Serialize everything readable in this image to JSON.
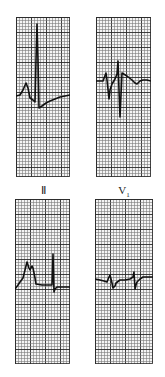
{
  "figure": {
    "grid": {
      "small_cell_px": 3,
      "major_every": 5,
      "minor_color": "#7a7a7a",
      "major_color": "#2a2a2a",
      "paper_color": "#f4f4f4"
    },
    "trace_color": "#111111",
    "labels": {
      "top_left": "Ⅱ",
      "top_right_main": "V",
      "top_right_sub": "1"
    },
    "panels": [
      {
        "id": "top-left",
        "lead": "II",
        "x": 16,
        "y": 17,
        "w": 54,
        "h": 160,
        "trace": [
          [
            16,
            96
          ],
          [
            20,
            95
          ],
          [
            23,
            90
          ],
          [
            26,
            83
          ],
          [
            28,
            88
          ],
          [
            30,
            98
          ],
          [
            33,
            100
          ],
          [
            35,
            102
          ],
          [
            36,
            60
          ],
          [
            37,
            24
          ],
          [
            38,
            60
          ],
          [
            39,
            108
          ],
          [
            42,
            106
          ],
          [
            46,
            103
          ],
          [
            50,
            101
          ],
          [
            55,
            99
          ],
          [
            60,
            97
          ],
          [
            65,
            96
          ],
          [
            70,
            95
          ]
        ]
      },
      {
        "id": "top-right",
        "lead": "V1",
        "x": 96,
        "y": 17,
        "w": 55,
        "h": 160,
        "trace": [
          [
            96,
            81
          ],
          [
            103,
            81
          ],
          [
            106,
            73
          ],
          [
            107,
            80
          ],
          [
            109,
            99
          ],
          [
            110,
            90
          ],
          [
            112,
            84
          ],
          [
            115,
            79
          ],
          [
            117,
            74
          ],
          [
            118,
            61
          ],
          [
            119,
            90
          ],
          [
            120,
            117
          ],
          [
            121,
            95
          ],
          [
            122,
            73
          ],
          [
            127,
            76
          ],
          [
            132,
            80
          ],
          [
            135,
            83
          ],
          [
            137,
            84
          ],
          [
            140,
            81
          ],
          [
            143,
            80
          ],
          [
            147,
            80
          ],
          [
            151,
            81
          ]
        ]
      },
      {
        "id": "bottom-left",
        "lead": "II",
        "x": 15,
        "y": 199,
        "w": 55,
        "h": 165,
        "trace": [
          [
            15,
            289
          ],
          [
            18,
            285
          ],
          [
            20,
            282
          ],
          [
            23,
            278
          ],
          [
            25,
            270
          ],
          [
            27,
            262
          ],
          [
            29,
            268
          ],
          [
            30,
            270
          ],
          [
            32,
            266
          ],
          [
            33,
            268
          ],
          [
            35,
            278
          ],
          [
            36,
            284
          ],
          [
            42,
            285
          ],
          [
            52,
            285
          ],
          [
            52.5,
            270
          ],
          [
            53,
            254
          ],
          [
            53.5,
            272
          ],
          [
            54,
            292
          ],
          [
            55,
            289
          ],
          [
            57,
            287
          ],
          [
            62,
            287
          ],
          [
            70,
            287
          ]
        ]
      },
      {
        "id": "bottom-right",
        "lead": "V1",
        "x": 95,
        "y": 199,
        "w": 58,
        "h": 165,
        "trace": [
          [
            95,
            279
          ],
          [
            100,
            280
          ],
          [
            104,
            281
          ],
          [
            107,
            282
          ],
          [
            109,
            277
          ],
          [
            110,
            275
          ],
          [
            112,
            283
          ],
          [
            113,
            288
          ],
          [
            115,
            286
          ],
          [
            116,
            283
          ],
          [
            120,
            280
          ],
          [
            125,
            280
          ],
          [
            130,
            279
          ],
          [
            133,
            277
          ],
          [
            134,
            272
          ],
          [
            135,
            289
          ],
          [
            136,
            285
          ],
          [
            137,
            282
          ],
          [
            140,
            279
          ],
          [
            143,
            277
          ],
          [
            148,
            277
          ],
          [
            153,
            277
          ]
        ]
      }
    ]
  }
}
